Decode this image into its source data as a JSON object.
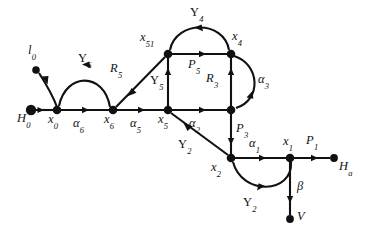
{
  "figure": {
    "type": "directed-graph-diagram",
    "background_color": "#ffffff",
    "ink_color": "#111111",
    "width": 370,
    "height": 239
  },
  "nodes": [
    {
      "id": "H0",
      "label_base": "H",
      "label_sub": "0",
      "x": 31,
      "y": 110,
      "r": 5.2,
      "label_x": 20,
      "label_y": 118
    },
    {
      "id": "l0",
      "label_base": "l",
      "label_sub": "0",
      "x": 36,
      "y": 70,
      "r": 3.6,
      "label_x": 27,
      "label_y": 50
    },
    {
      "id": "x0",
      "label_base": "x",
      "label_sub": "0",
      "x": 57,
      "y": 110,
      "r": 4.2,
      "label_x": 47,
      "label_y": 118
    },
    {
      "id": "x6",
      "label_base": "x",
      "label_sub": "6",
      "x": 113,
      "y": 110,
      "r": 4.2,
      "label_x": 104,
      "label_y": 118
    },
    {
      "id": "x5",
      "label_base": "x",
      "label_sub": "5",
      "x": 168,
      "y": 110,
      "r": 4.2,
      "label_x": 159,
      "label_y": 118
    },
    {
      "id": "x51",
      "label_base": "x",
      "label_sub": "51",
      "x": 168,
      "y": 54,
      "r": 4.2,
      "label_x": 140,
      "label_y": 38
    },
    {
      "id": "x4",
      "label_base": "x",
      "label_sub": "4",
      "x": 231,
      "y": 54,
      "r": 4.2,
      "label_x": 232,
      "label_y": 36
    },
    {
      "id": "n3",
      "label_base": "",
      "label_sub": "",
      "x": 231,
      "y": 110,
      "r": 4.2,
      "label_x": 0,
      "label_y": 0
    },
    {
      "id": "x2",
      "label_base": "x",
      "label_sub": "2",
      "x": 231,
      "y": 158,
      "r": 4.2,
      "label_x": 212,
      "label_y": 166
    },
    {
      "id": "x1",
      "label_base": "x",
      "label_sub": "1",
      "x": 290,
      "y": 158,
      "r": 4.2,
      "label_x": 283,
      "label_y": 140
    },
    {
      "id": "Ha",
      "label_base": "H",
      "label_sub": "a",
      "x": 334,
      "y": 158,
      "r": 3.8,
      "label_x": 338,
      "label_y": 163
    },
    {
      "id": "V",
      "label_base": "V",
      "label_sub": "",
      "x": 290,
      "y": 219,
      "r": 3.8,
      "label_x": 296,
      "label_y": 213
    }
  ],
  "edges": [
    {
      "id": "e-alpha6",
      "from": "x0",
      "to": "x6",
      "label_base": "α",
      "label_sub": "6",
      "label_x": 75,
      "label_y": 120,
      "shape": "straight"
    },
    {
      "id": "e-alpha5",
      "from": "x6",
      "to": "x5",
      "label_base": "α",
      "label_sub": "5",
      "label_x": 131,
      "label_y": 120,
      "shape": "straight"
    },
    {
      "id": "e-alpha2",
      "from": "x5",
      "to": "n3",
      "label_base": "α",
      "label_sub": "2",
      "label_x": 190,
      "label_y": 120,
      "shape": "straight"
    },
    {
      "id": "e-alpha1",
      "from": "x2",
      "to": "x1",
      "label_base": "α",
      "label_sub": "1",
      "label_x": 250,
      "label_y": 142,
      "shape": "straight"
    },
    {
      "id": "e-P1",
      "from": "x1",
      "to": "Ha",
      "label_base": "P",
      "label_sub": "1",
      "label_x": 308,
      "label_y": 140,
      "shape": "straight"
    },
    {
      "id": "e-P5",
      "from": "x51",
      "to": "x4",
      "label_base": "P",
      "label_sub": "5",
      "label_x": 189,
      "label_y": 64,
      "shape": "straight"
    },
    {
      "id": "e-P3",
      "from": "n3",
      "to": "x2",
      "label_base": "P",
      "label_sub": "3",
      "label_x": 236,
      "label_y": 128,
      "shape": "straight"
    },
    {
      "id": "e-R3",
      "from": "n3",
      "to": "x4",
      "label_base": "R",
      "label_sub": "3",
      "label_x": 209,
      "label_y": 78,
      "shape": "straight"
    },
    {
      "id": "e-R5",
      "from": "x51",
      "to": "x6",
      "label_base": "R",
      "label_sub": "5",
      "label_x": 112,
      "label_y": 68,
      "shape": "straight-diagonal"
    },
    {
      "id": "e-Y5",
      "from": "x5",
      "to": "x51",
      "label_base": "Υ",
      "label_sub": "5",
      "label_x": 153,
      "label_y": 80,
      "shape": "straight"
    },
    {
      "id": "e-Y6",
      "from": "x6",
      "to": "x0",
      "label_base": "Υ",
      "label_sub": "6",
      "label_x": 80,
      "label_y": 58,
      "shape": "arc-up"
    },
    {
      "id": "e-Y4",
      "from": "x4",
      "to": "x51",
      "label_base": "Υ",
      "label_sub": "4",
      "label_x": 190,
      "label_y": 10,
      "shape": "arc-up"
    },
    {
      "id": "e-alpha3",
      "from": "x4",
      "to": "n3",
      "label_base": "α",
      "label_sub": "3",
      "label_x": 259,
      "label_y": 78,
      "shape": "arc-right"
    },
    {
      "id": "e-Y2-diag",
      "from": "x2",
      "to": "x5",
      "label_base": "Υ",
      "label_sub": "2",
      "label_x": 181,
      "label_y": 142,
      "shape": "straight-diagonal"
    },
    {
      "id": "e-Y2-arc",
      "from": "x1",
      "to": "x2",
      "label_base": "Υ",
      "label_sub": "2",
      "label_x": 245,
      "label_y": 200,
      "shape": "arc-down"
    },
    {
      "id": "e-beta",
      "from": "x1",
      "to": "V",
      "label_base": "β",
      "label_sub": "",
      "label_x": 297,
      "label_y": 186,
      "shape": "straight"
    },
    {
      "id": "e-l0",
      "from": "x0",
      "to": "l0",
      "label_base": "",
      "label_sub": "",
      "label_x": 0,
      "label_y": 0,
      "shape": "straight"
    },
    {
      "id": "e-H0",
      "from": "H0",
      "to": "x0",
      "label_base": "",
      "label_sub": "",
      "label_x": 0,
      "label_y": 0,
      "shape": "straight"
    }
  ]
}
